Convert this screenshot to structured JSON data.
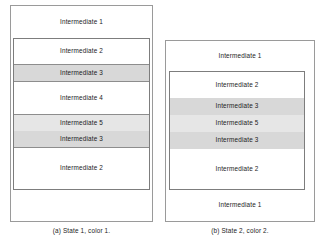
{
  "figure": {
    "colors": {
      "outer_border": "#9a9a9a",
      "inner_border": "#7d7d7d",
      "divider": "#8d8d8d",
      "shade_light": "#e6e6e6",
      "shade_dark": "#d8d8d8",
      "background": "#ffffff",
      "text": "#1c1c1c"
    },
    "panels": [
      {
        "id": "a",
        "caption": "(a) State 1, color 1.",
        "outer_bands": [
          {
            "label": "Intermediate 1",
            "shade": "none",
            "position": "top"
          },
          {
            "label": "Intermediate 1",
            "shade": "none",
            "position": "bottom"
          }
        ],
        "inner_bands": [
          {
            "label": "Intermediate 2",
            "shade": "none"
          },
          {
            "label": "Intermediate 3",
            "shade": "dark"
          },
          {
            "label": "Intermediate 4",
            "shade": "none"
          },
          {
            "label": "Intermediate 5",
            "shade": "light"
          },
          {
            "label": "Intermediate 3",
            "shade": "dark"
          },
          {
            "label": "Intermediate 2",
            "shade": "none"
          }
        ]
      },
      {
        "id": "b",
        "caption": "(b) State 2, color 2.",
        "outer_bands": [
          {
            "label": "Intermediate 1",
            "shade": "none",
            "position": "top"
          },
          {
            "label": "Intermediate 1",
            "shade": "none",
            "position": "bottom"
          }
        ],
        "inner_bands": [
          {
            "label": "Intermediate 2",
            "shade": "none"
          },
          {
            "label": "Intermediate 3",
            "shade": "dark"
          },
          {
            "label": "Intermediate 5",
            "shade": "light"
          },
          {
            "label": "Intermediate 3",
            "shade": "dark"
          },
          {
            "label": "Intermediate 2",
            "shade": "none"
          }
        ]
      }
    ]
  }
}
